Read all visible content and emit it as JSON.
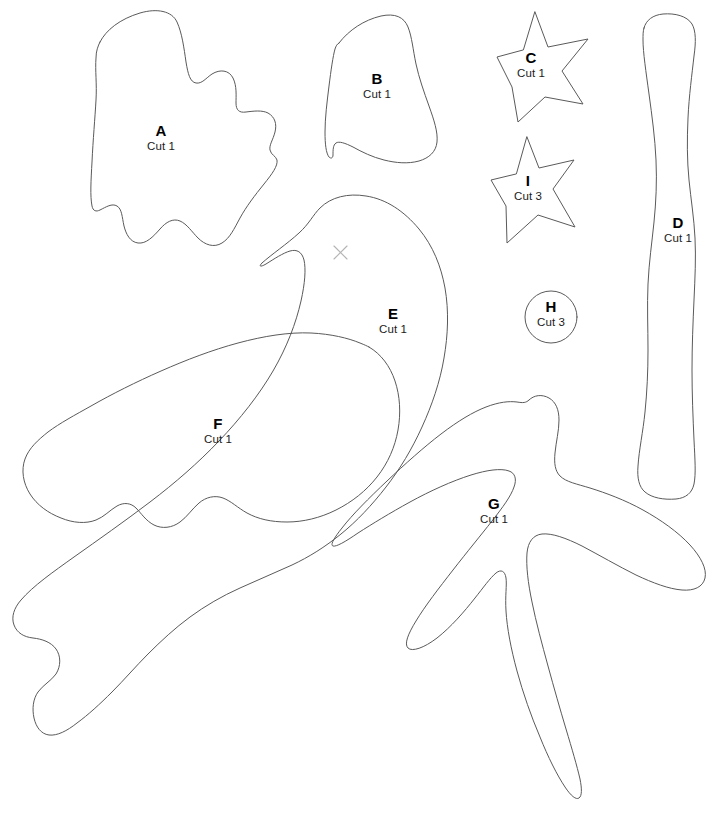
{
  "document": {
    "type": "craft-sewing-pattern-template",
    "title": "Bird Applique Pattern Pieces",
    "background_color": "#ffffff",
    "line_color": "#5a5a5a",
    "mark_color": "#b4b4b4",
    "width": 723,
    "height": 838
  },
  "pieces": [
    {
      "id": "a",
      "letter": "A",
      "cut": "Cut 1",
      "shape": "irregular-blob",
      "label_x": 161,
      "label_y": 122
    },
    {
      "id": "b",
      "letter": "B",
      "cut": "Cut 1",
      "shape": "rounded-quadrilateral",
      "label_x": 377,
      "label_y": 70
    },
    {
      "id": "c",
      "letter": "C",
      "cut": "Cut 1",
      "shape": "five-point-star",
      "label_x": 531,
      "label_y": 49
    },
    {
      "id": "d",
      "letter": "D",
      "cut": "Cut 1",
      "shape": "long-curved-branch",
      "label_x": 678,
      "label_y": 214
    },
    {
      "id": "e",
      "letter": "E",
      "cut": "Cut 1",
      "shape": "bird-body",
      "label_x": 393,
      "label_y": 305
    },
    {
      "id": "f",
      "letter": "F",
      "cut": "Cut 1",
      "shape": "bird-wing",
      "label_x": 218,
      "label_y": 415
    },
    {
      "id": "g",
      "letter": "G",
      "cut": "Cut 1",
      "shape": "leaf-sprig",
      "label_x": 494,
      "label_y": 495
    },
    {
      "id": "h",
      "letter": "H",
      "cut": "Cut 3",
      "shape": "circle",
      "label_x": 551,
      "label_y": 298
    },
    {
      "id": "i",
      "letter": "I",
      "cut": "Cut 3",
      "shape": "five-point-star",
      "label_x": 528,
      "label_y": 172
    }
  ],
  "marks": [
    {
      "id": "eye-placement",
      "name": "x-mark",
      "x": 340,
      "y": 252
    }
  ]
}
